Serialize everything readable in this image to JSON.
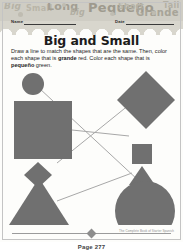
{
  "decor_band": {
    "words": [
      "Big",
      "Small",
      "Long",
      "big",
      "Pequeño",
      "Short",
      "Grande",
      "Tall"
    ],
    "background_color": "#cfcdc4",
    "text_color": "#a9a69a"
  },
  "form": {
    "name_label": "Name",
    "date_label": "Date"
  },
  "worksheet": {
    "title": "Big and Small",
    "instructions_parts": [
      {
        "text": "Draw a line to match the shapes that are the same. Then, color each shape that is ",
        "bold": false
      },
      {
        "text": "grande",
        "bold": true
      },
      {
        "text": " red. Color each shape that is ",
        "bold": false
      },
      {
        "text": "pequeño",
        "bold": true
      },
      {
        "text": " green.",
        "bold": false
      }
    ],
    "instructions_plain": "Draw a line to match the shapes that are the same. Then, color each shape that is grande red. Color each shape that is pequeño green.",
    "shape_fill_color": "#707070",
    "line_color": "#a8a8a8",
    "left_column": [
      {
        "shape": "circle",
        "size": "small",
        "label": "circle-small"
      },
      {
        "shape": "square",
        "size": "large",
        "label": "square-large"
      },
      {
        "shape": "diamond",
        "size": "small",
        "label": "diamond-small"
      },
      {
        "shape": "triangle",
        "size": "large",
        "label": "triangle-large"
      }
    ],
    "right_column": [
      {
        "shape": "diamond",
        "size": "large",
        "label": "diamond-large"
      },
      {
        "shape": "square",
        "size": "small",
        "label": "square-small"
      },
      {
        "shape": "triangle",
        "size": "small",
        "label": "triangle-small"
      },
      {
        "shape": "circle",
        "size": "large",
        "label": "circle-large"
      }
    ],
    "matching_lines": [
      {
        "from": "circle-small",
        "to": "triangle-small"
      },
      {
        "from": "square-large",
        "to": "square-small"
      },
      {
        "from": "diamond-small",
        "to": "diamond-large"
      },
      {
        "from": "triangle-large",
        "to": "circle-large"
      }
    ]
  },
  "footer": {
    "page_number": "",
    "credit": "The Complete Book of Starter Spanish"
  },
  "caption": {
    "text": "Page 277"
  }
}
